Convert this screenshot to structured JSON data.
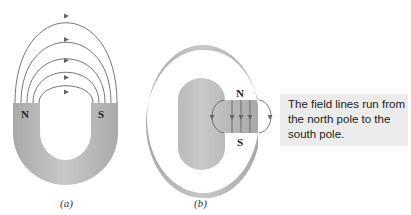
{
  "figure_a": {
    "caption": "(a)",
    "north_label": "N",
    "south_label": "S",
    "field_line_count": 5
  },
  "figure_b": {
    "caption": "(b)",
    "north_label": "N",
    "south_label": "S",
    "field_line_count": 5
  },
  "callout": {
    "text": "The field lines run from the north pole to the south pole."
  },
  "colors": {
    "magnet": "#b4b4b4",
    "lines": "#666666",
    "callout_bg": "#ececec"
  }
}
